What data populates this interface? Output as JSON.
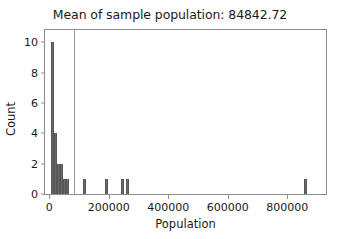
{
  "chart_data": {
    "type": "bar",
    "title": "Mean of sample population: 84842.72",
    "xlabel": "Population",
    "ylabel": "Count",
    "xlim": [
      -14000,
      930000
    ],
    "ylim": [
      0,
      10.8
    ],
    "grid": false,
    "legend": null,
    "bin_width": 10000,
    "bar_color": "#6b6b6b",
    "mean_line_color": "#9a9a9a",
    "mean_value": 84842.72,
    "xticks": [
      0,
      200000,
      400000,
      600000,
      800000
    ],
    "xtick_labels": [
      "0",
      "200000",
      "400000",
      "600000",
      "800000"
    ],
    "yticks": [
      0,
      2,
      4,
      6,
      8,
      10
    ],
    "ytick_labels": [
      "0",
      "2",
      "4",
      "6",
      "8",
      "10"
    ],
    "bins": [
      {
        "x": 10000,
        "count": 10
      },
      {
        "x": 20000,
        "count": 4
      },
      {
        "x": 30000,
        "count": 2
      },
      {
        "x": 40000,
        "count": 2
      },
      {
        "x": 50000,
        "count": 1
      },
      {
        "x": 60000,
        "count": 1
      },
      {
        "x": 120000,
        "count": 1
      },
      {
        "x": 193000,
        "count": 1
      },
      {
        "x": 247000,
        "count": 1
      },
      {
        "x": 263000,
        "count": 1
      },
      {
        "x": 860000,
        "count": 1
      }
    ],
    "annotations": [
      {
        "type": "vline",
        "name": "mean-line",
        "x": 84842.72
      }
    ]
  }
}
